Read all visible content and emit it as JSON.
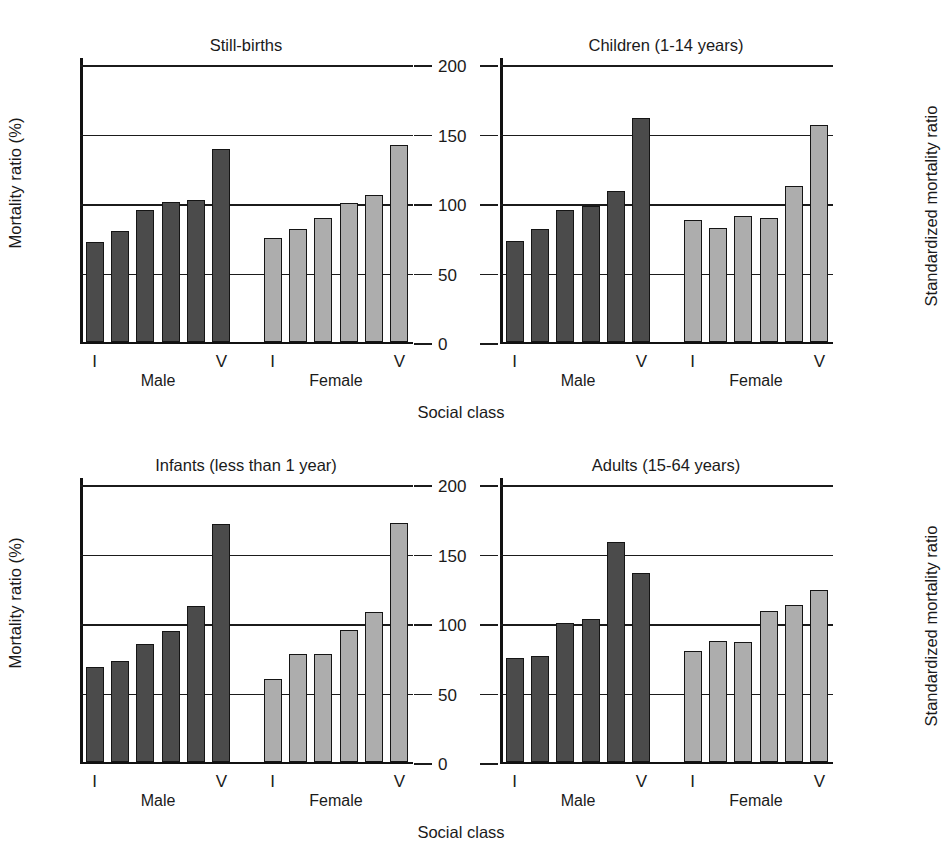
{
  "figure": {
    "axis_titles": {
      "left": "Mortality ratio (%)",
      "right": "Standardized mortality ratio",
      "x": "Social class"
    },
    "group_labels": {
      "male": "Male",
      "female": "Female"
    },
    "class_first": "I",
    "class_last": "V",
    "colors": {
      "male": "#4b4b4b",
      "female": "#adadad",
      "axis": "#151515"
    },
    "caption": ""
  },
  "chart_data": [
    {
      "id": "still-births",
      "type": "bar",
      "title": "Still-births",
      "xlabel": "Social class",
      "ylabel": "Mortality ratio (%)",
      "ylim": [
        0,
        200
      ],
      "yticks": [
        0,
        50,
        100,
        150,
        200
      ],
      "grid": true,
      "legend": "none",
      "categories": [
        "I",
        "II",
        "III",
        "IIIb",
        "IV",
        "V"
      ],
      "series": [
        {
          "name": "Male",
          "values": [
            72,
            80,
            95,
            101,
            102,
            139
          ]
        },
        {
          "name": "Female",
          "values": [
            75,
            81,
            89,
            100,
            106,
            142
          ]
        }
      ]
    },
    {
      "id": "children",
      "type": "bar",
      "title": "Children (1-14 years)",
      "xlabel": "Social class",
      "ylabel": "Standardized mortality ratio",
      "ylim": [
        0,
        200
      ],
      "yticks": [
        0,
        50,
        100,
        150,
        200
      ],
      "grid": true,
      "legend": "none",
      "categories": [
        "I",
        "II",
        "III",
        "IIIb",
        "IV",
        "V"
      ],
      "series": [
        {
          "name": "Male",
          "values": [
            73,
            81,
            95,
            98,
            109,
            161
          ]
        },
        {
          "name": "Female",
          "values": [
            88,
            82,
            91,
            89,
            112,
            156
          ]
        }
      ]
    },
    {
      "id": "infants",
      "type": "bar",
      "title": "Infants (less than 1 year)",
      "xlabel": "Social class",
      "ylabel": "Mortality ratio (%)",
      "ylim": [
        0,
        200
      ],
      "yticks": [
        0,
        50,
        100,
        150,
        200
      ],
      "grid": true,
      "legend": "none",
      "categories": [
        "I",
        "II",
        "III",
        "IIIb",
        "IV",
        "V"
      ],
      "series": [
        {
          "name": "Male",
          "values": [
            68,
            73,
            85,
            94,
            112,
            171
          ]
        },
        {
          "name": "Female",
          "values": [
            60,
            78,
            78,
            95,
            108,
            172
          ]
        }
      ]
    },
    {
      "id": "adults",
      "type": "bar",
      "title": "Adults (15-64 years)",
      "xlabel": "Social class",
      "ylabel": "Standardized mortality ratio",
      "ylim": [
        0,
        200
      ],
      "yticks": [
        0,
        50,
        100,
        150,
        200
      ],
      "grid": true,
      "legend": "none",
      "categories": [
        "I",
        "II",
        "III",
        "IIIb",
        "IV",
        "V"
      ],
      "series": [
        {
          "name": "Male",
          "values": [
            75,
            76,
            100,
            103,
            158,
            136
          ]
        },
        {
          "name": "Female",
          "values": [
            80,
            87,
            86,
            109,
            113,
            124
          ]
        }
      ]
    }
  ]
}
